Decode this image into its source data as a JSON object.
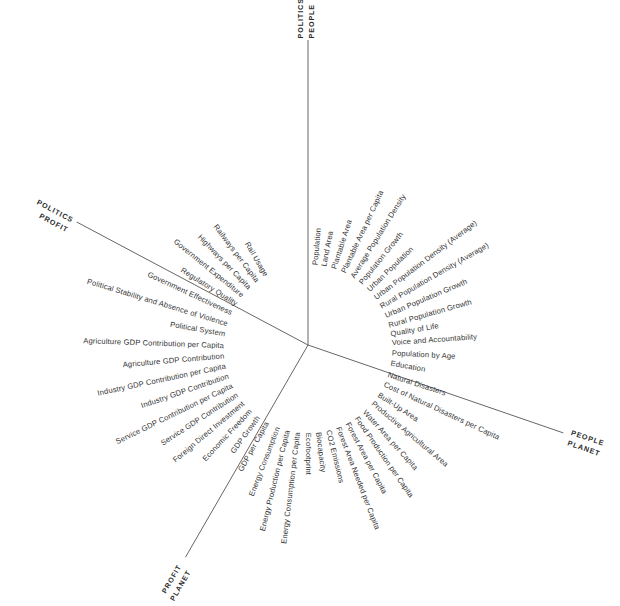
{
  "diagram": {
    "center": {
      "x": 308,
      "y": 345
    },
    "line_color": "#555555",
    "text_color": "#333333",
    "background": "#ffffff",
    "axes": [
      {
        "name": "axis-top",
        "angle_deg": -90,
        "length": 305,
        "labels": [
          "POLITICS",
          "PEOPLE"
        ]
      },
      {
        "name": "axis-lower-right",
        "angle_deg": 19,
        "length": 270,
        "labels": [
          "PEOPLE",
          "PLANET"
        ]
      },
      {
        "name": "axis-lower-left",
        "angle_deg": 120,
        "length": 245,
        "labels": [
          "PLANET",
          "PROFIT"
        ]
      },
      {
        "name": "axis-upper-left",
        "angle_deg": 208,
        "length": 262,
        "labels": [
          "PROFIT",
          "POLITICS"
        ]
      }
    ],
    "spokes": [
      {
        "label": "Population",
        "angle_deg": -85,
        "radius": 84
      },
      {
        "label": "Land Area",
        "angle_deg": -79,
        "radius": 84
      },
      {
        "label": "Plantable Area",
        "angle_deg": -72,
        "radius": 84
      },
      {
        "label": "Plantable Area per Capita",
        "angle_deg": -65,
        "radius": 84
      },
      {
        "label": "Average Population Density",
        "angle_deg": -58,
        "radius": 84
      },
      {
        "label": "Population Growth",
        "angle_deg": -51,
        "radius": 84
      },
      {
        "label": "Urban Population",
        "angle_deg": -44,
        "radius": 84
      },
      {
        "label": "Urban Population Density (Average)",
        "angle_deg": -37,
        "radius": 84
      },
      {
        "label": "Rural Population Density (Average)",
        "angle_deg": -30,
        "radius": 84
      },
      {
        "label": "Urban Population Growth",
        "angle_deg": -23,
        "radius": 84
      },
      {
        "label": "Rural Population Growth",
        "angle_deg": -16,
        "radius": 84
      },
      {
        "label": "Quality of Life",
        "angle_deg": -10,
        "radius": 84
      },
      {
        "label": "Voice and Accountability",
        "angle_deg": -4,
        "radius": 84
      },
      {
        "label": "Population by Age",
        "angle_deg": 3,
        "radius": 84
      },
      {
        "label": "Education",
        "angle_deg": 10,
        "radius": 84
      },
      {
        "label": "Natural Disasters",
        "angle_deg": 18,
        "radius": 84
      },
      {
        "label": "Cost of Natural Disasters per Capita",
        "angle_deg": 25,
        "radius": 84
      },
      {
        "label": "Built-Up Area",
        "angle_deg": 33,
        "radius": 84
      },
      {
        "label": "Productive Agricultural Area",
        "angle_deg": 40,
        "radius": 84
      },
      {
        "label": "Water Area per Capita",
        "angle_deg": 48,
        "radius": 84
      },
      {
        "label": "Food Production per Capita",
        "angle_deg": 55,
        "radius": 84
      },
      {
        "label": "Forest Area per Capita",
        "angle_deg": 62,
        "radius": 84
      },
      {
        "label": "Forest Area Needed per Capita",
        "angle_deg": 69,
        "radius": 84
      },
      {
        "label": "CO2 Emissions",
        "angle_deg": 76,
        "radius": 84
      },
      {
        "label": "Biocapacity",
        "angle_deg": 83,
        "radius": 84
      },
      {
        "label": "Ecofootprint",
        "angle_deg": 90,
        "radius": 84
      },
      {
        "label": "Energy Consumption per Capita",
        "angle_deg": 97,
        "radius": 84
      },
      {
        "label": "Energy Production per Capita",
        "angle_deg": 104,
        "radius": 84
      },
      {
        "label": "Energy Consumption",
        "angle_deg": 111,
        "radius": 84
      },
      {
        "label": "GDP per Capita",
        "angle_deg": 119,
        "radius": 84
      },
      {
        "label": "GDP Growth",
        "angle_deg": 126,
        "radius": 84
      },
      {
        "label": "Economic Freedom",
        "angle_deg": 133,
        "radius": 84
      },
      {
        "label": "Foreign Direct Investment",
        "angle_deg": 140,
        "radius": 84
      },
      {
        "label": "Service GDP Contribution",
        "angle_deg": 147,
        "radius": 84
      },
      {
        "label": "Service GDP Contribution per Capita",
        "angle_deg": 154,
        "radius": 84
      },
      {
        "label": "Industry GDP Contribution",
        "angle_deg": 161,
        "radius": 84
      },
      {
        "label": "Industry GDP Contribution per Capita",
        "angle_deg": 168,
        "radius": 84
      },
      {
        "label": "Agriculture GDP Contribution",
        "angle_deg": 175,
        "radius": 84
      },
      {
        "label": "Agriculture GDP Contribution per Capita",
        "angle_deg": 182,
        "radius": 84
      },
      {
        "label": "Political System",
        "angle_deg": 190,
        "radius": 84
      },
      {
        "label": "Political Stability and Absence of Violence",
        "angle_deg": 197,
        "radius": 84
      },
      {
        "label": "Government Effectiveness",
        "angle_deg": 205,
        "radius": 84
      },
      {
        "label": "Regulatory Quality",
        "angle_deg": 212,
        "radius": 84
      },
      {
        "label": "Government Expenditure",
        "angle_deg": 219,
        "radius": 84
      },
      {
        "label": "Highways per Capita",
        "angle_deg": 226,
        "radius": 84
      },
      {
        "label": "Railways per Capita",
        "angle_deg": 233,
        "radius": 84
      },
      {
        "label": "Rail Usage",
        "angle_deg": 240,
        "radius": 84
      }
    ]
  },
  "chart_data": {
    "type": "radial-label-diagram",
    "xlabel": "",
    "ylabel": "",
    "grid": false,
    "legend_position": "none",
    "quadrants": [
      {
        "name": "People",
        "boundary_labels": [
          "POLITICS",
          "PEOPLE"
        ],
        "indicators": [
          "Population",
          "Land Area",
          "Plantable Area",
          "Plantable Area per Capita",
          "Average Population Density",
          "Population Growth",
          "Urban Population",
          "Urban Population Density (Average)",
          "Rural Population Density (Average)",
          "Urban Population Growth",
          "Rural Population Growth",
          "Quality of Life",
          "Voice and Accountability",
          "Population by Age",
          "Education"
        ]
      },
      {
        "name": "Planet",
        "boundary_labels": [
          "PEOPLE",
          "PLANET"
        ],
        "indicators": [
          "Natural Disasters",
          "Cost of Natural Disasters per Capita",
          "Built-Up Area",
          "Productive Agricultural Area",
          "Water Area per Capita",
          "Food Production per Capita",
          "Forest Area per Capita",
          "Forest Area Needed per Capita",
          "CO2 Emissions",
          "Biocapacity",
          "Ecofootprint"
        ]
      },
      {
        "name": "Profit",
        "boundary_labels": [
          "PLANET",
          "PROFIT"
        ],
        "indicators": [
          "Energy Consumption per Capita",
          "Energy Production per Capita",
          "Energy Consumption",
          "GDP per Capita",
          "GDP Growth",
          "Economic Freedom",
          "Foreign Direct Investment",
          "Service GDP Contribution",
          "Service GDP Contribution per Capita",
          "Industry GDP Contribution",
          "Industry GDP Contribution per Capita",
          "Agriculture GDP Contribution",
          "Agriculture GDP Contribution per Capita"
        ]
      },
      {
        "name": "Politics",
        "boundary_labels": [
          "PROFIT",
          "POLITICS"
        ],
        "indicators": [
          "Political System",
          "Political Stability and Absence of Violence",
          "Government Effectiveness",
          "Regulatory Quality",
          "Government Expenditure",
          "Highways per Capita",
          "Railways per Capita",
          "Rail Usage"
        ]
      }
    ],
    "axis_endpoint_labels": [
      {
        "position": "top",
        "labels": [
          "POLITICS",
          "PEOPLE"
        ]
      },
      {
        "position": "lower-right",
        "labels": [
          "PEOPLE",
          "PLANET"
        ]
      },
      {
        "position": "lower-left",
        "labels": [
          "PLANET",
          "PROFIT"
        ]
      },
      {
        "position": "upper-left",
        "labels": [
          "PROFIT",
          "POLITICS"
        ]
      }
    ],
    "total_indicators": 47
  }
}
